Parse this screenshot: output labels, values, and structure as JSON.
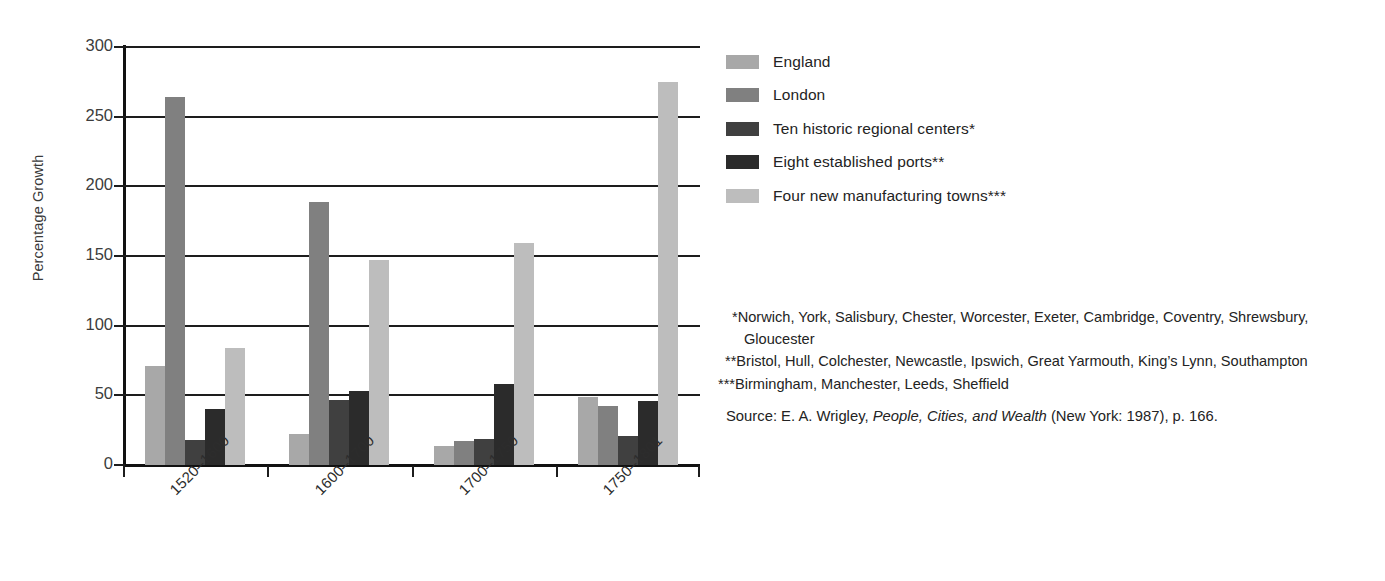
{
  "chart_data": {
    "type": "bar",
    "title": "",
    "xlabel": "",
    "ylabel": "Percentage Growth",
    "ylim": [
      0,
      300
    ],
    "yticks": [
      0,
      50,
      100,
      150,
      200,
      250,
      300
    ],
    "grid": true,
    "legend_position": "right",
    "categories": [
      "1520–1600",
      "1600–1700",
      "1700–1750",
      "1750–1801"
    ],
    "series": [
      {
        "name": "England",
        "color": "#a8a8a8",
        "values": [
          71,
          22,
          14,
          49
        ]
      },
      {
        "name": "London",
        "color": "#808080",
        "values": [
          264,
          189,
          17,
          42
        ]
      },
      {
        "name": "Ten historic regional centers*",
        "color": "#404040",
        "values": [
          18,
          47,
          19,
          21
        ]
      },
      {
        "name": "Eight established ports**",
        "color": "#2b2b2b",
        "values": [
          40,
          53,
          58,
          46
        ]
      },
      {
        "name": "Four new manufacturing towns***",
        "color": "#bdbdbd",
        "values": [
          84,
          147,
          159,
          275
        ]
      }
    ]
  },
  "legend": {
    "items": [
      {
        "label": "England"
      },
      {
        "label": "London"
      },
      {
        "label": "Ten historic regional centers*"
      },
      {
        "label": "Eight established ports**"
      },
      {
        "label": "Four new manufacturing towns***"
      }
    ]
  },
  "notes": {
    "note1": "*Norwich, York, Salisbury, Chester, Worcester, Exeter, Cambridge, Coventry, Shrewsbury, Gloucester",
    "note2": "**Bristol, Hull, Colchester, Newcastle, Ipswich, Great Yarmouth, King’s Lynn, Southampton",
    "note3": "***Birmingham, Manchester, Leeds, Sheffield",
    "source_prefix": "Source: E. A. Wrigley, ",
    "source_title": "People, Cities, and Wealth",
    "source_suffix": " (New York: 1987), p. 166."
  },
  "colors": {
    "axis": "#1d1d1d",
    "text": "#232323",
    "background": "#ffffff"
  }
}
